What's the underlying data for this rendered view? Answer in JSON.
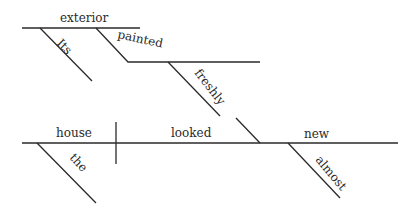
{
  "diagram": {
    "type": "sentence-diagram",
    "sentence_words": {
      "subject": "house",
      "verb": "looked",
      "predicate_adjective": "new",
      "subject_modifier": "the",
      "adjective_modifier": "almost",
      "participle_object": "exterior",
      "object_modifier": "Its",
      "participle": "painted",
      "participle_modifier": "freshly"
    }
  }
}
